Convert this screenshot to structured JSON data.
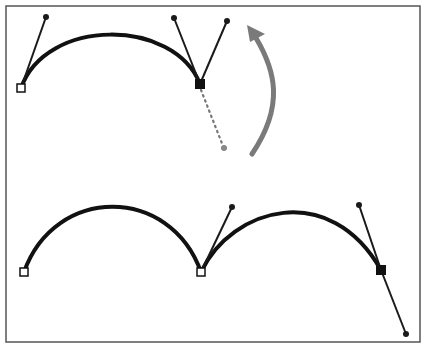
{
  "diagram": {
    "title": "",
    "colors": {
      "background": "#ffffff",
      "frame": "#555555",
      "curve": "#111111",
      "handle": "#1a1a1a",
      "dotted_handle": "#777777",
      "arrow": "#7a7a7a"
    },
    "frame": {
      "x": 6,
      "y": 6,
      "width": 414,
      "height": 336
    },
    "top_path": {
      "description": "Curve segment with smooth anchor being converted; direction handle rotated upward",
      "anchors": [
        {
          "x": 21,
          "y": 88,
          "type": "open-square"
        },
        {
          "x": 200,
          "y": 84,
          "type": "filled-square"
        }
      ],
      "handles": [
        {
          "from": [
            21,
            88
          ],
          "to": [
            46,
            17
          ]
        },
        {
          "from": [
            200,
            84
          ],
          "to": [
            174,
            18
          ]
        },
        {
          "from": [
            200,
            84
          ],
          "to": [
            227,
            21
          ]
        }
      ],
      "original_handle": {
        "from": [
          200,
          84
        ],
        "to": [
          224,
          148
        ],
        "style": "dotted"
      },
      "rotation_arrow": {
        "from": [
          252,
          154
        ],
        "to": [
          250,
          30
        ],
        "direction": "up"
      }
    },
    "bottom_path": {
      "description": "Two-segment curve with corner point and selected anchor",
      "anchors": [
        {
          "x": 24,
          "y": 272,
          "type": "open-square"
        },
        {
          "x": 201,
          "y": 272,
          "type": "open-square"
        },
        {
          "x": 381,
          "y": 270,
          "type": "filled-square"
        }
      ],
      "handles": [
        {
          "from": [
            201,
            272
          ],
          "to": [
            232,
            207
          ]
        },
        {
          "from": [
            381,
            270
          ],
          "to": [
            359,
            205
          ]
        },
        {
          "from": [
            381,
            270
          ],
          "to": [
            406,
            334
          ]
        }
      ]
    }
  }
}
